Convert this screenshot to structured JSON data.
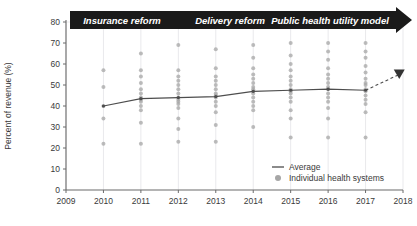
{
  "chart_data": {
    "type": "scatter",
    "title": "",
    "xlabel": "",
    "ylabel": "Percent of revenue (%)",
    "xlim": [
      2009,
      2018
    ],
    "ylim": [
      0,
      80
    ],
    "grid": true,
    "legend_position": "bottom-right",
    "x_ticks": [
      "2009",
      "2010",
      "2011",
      "2012",
      "2013",
      "2014",
      "2015",
      "2016",
      "2017",
      "2018"
    ],
    "y_ticks": [
      "0",
      "10",
      "20",
      "30",
      "40",
      "50",
      "60",
      "70",
      "80"
    ],
    "categories": [
      2010,
      2011,
      2012,
      2013,
      2014,
      2015,
      2016,
      2017
    ],
    "series": [
      {
        "name": "Average",
        "type": "line",
        "color": "#4d4d4d",
        "x": [
          2010,
          2011,
          2012,
          2013,
          2014,
          2015,
          2016,
          2017
        ],
        "values": [
          40.0,
          43.5,
          44.0,
          44.5,
          47.0,
          47.5,
          48.0,
          47.5
        ]
      },
      {
        "name": "Projection",
        "type": "line-dashed",
        "color": "#4d4d4d",
        "x": [
          2017,
          2017.9
        ],
        "values": [
          47.5,
          55.0
        ]
      }
    ],
    "scatter": {
      "name": "Individual health systems",
      "color": "#a6a6a6",
      "points": [
        {
          "x": 2010,
          "y": [
            57,
            49,
            40,
            34,
            22
          ]
        },
        {
          "x": 2011,
          "y": [
            65,
            57,
            54,
            51,
            48,
            46,
            44,
            43,
            42,
            40,
            38,
            32,
            22
          ]
        },
        {
          "x": 2012,
          "y": [
            69,
            57,
            54,
            52,
            50,
            48,
            46,
            44,
            43,
            42,
            41,
            39,
            34,
            29,
            23
          ]
        },
        {
          "x": 2013,
          "y": [
            67,
            58,
            54,
            52,
            50,
            48,
            46,
            45,
            44,
            42,
            40,
            37,
            31,
            23
          ]
        },
        {
          "x": 2014,
          "y": [
            69,
            63,
            58,
            55,
            53,
            51,
            49,
            48,
            47,
            46,
            44,
            42,
            40,
            38,
            30
          ]
        },
        {
          "x": 2015,
          "y": [
            70,
            64,
            60,
            57,
            54,
            52,
            50,
            48,
            47,
            46,
            44,
            42,
            38,
            34,
            25
          ]
        },
        {
          "x": 2016,
          "y": [
            70,
            66,
            62,
            58,
            55,
            53,
            51,
            49,
            48,
            46,
            44,
            42,
            39,
            34,
            25
          ]
        },
        {
          "x": 2017,
          "y": [
            70,
            66,
            63,
            59,
            56,
            53,
            51,
            50,
            48,
            47,
            45,
            43,
            41,
            37,
            25
          ]
        }
      ]
    }
  },
  "banner": {
    "segments": [
      {
        "label": "Insurance reform"
      },
      {
        "label": "Delivery reform"
      },
      {
        "label": "Public health utility model"
      }
    ],
    "fill": "#1a1a1a"
  },
  "legend": {
    "items": [
      {
        "label": "Average",
        "marker": "line",
        "color": "#4d4d4d"
      },
      {
        "label": "Individual health systems",
        "marker": "dot",
        "color": "#a6a6a6"
      }
    ]
  },
  "axes": {
    "ylabel": "Percent of revenue (%)",
    "y_ticks": [
      "80",
      "70",
      "60",
      "50",
      "40",
      "30",
      "20",
      "10",
      "0"
    ],
    "x_ticks": [
      "2009",
      "2010",
      "2011",
      "2012",
      "2013",
      "2014",
      "2015",
      "2016",
      "2017",
      "2018"
    ]
  },
  "colors": {
    "axis": "#6b6b6b",
    "grid": "#e9e9ec",
    "average_line": "#4d4d4d",
    "dot": "#a6a6a6",
    "banner": "#1a1a1a",
    "text": "#3a3a3a"
  }
}
